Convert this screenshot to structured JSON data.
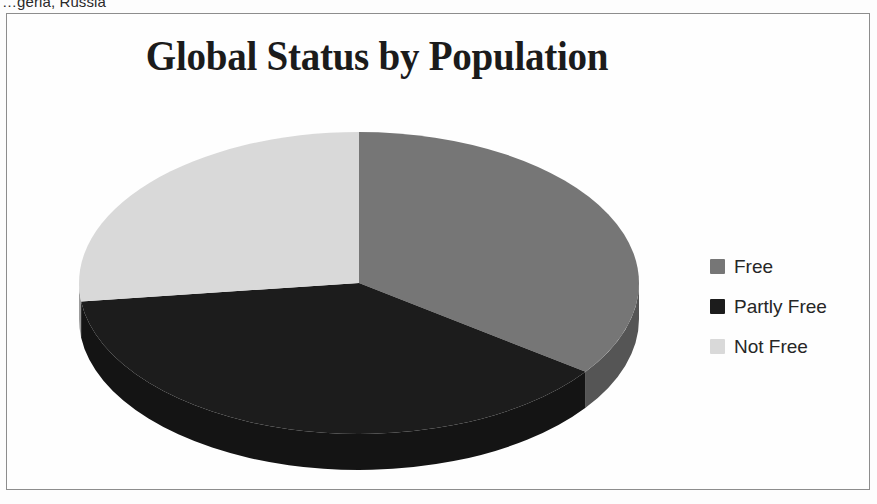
{
  "scan": {
    "top_cut_text": "…geria, Russia"
  },
  "chart": {
    "title": "Global Status by Population",
    "frame_border_color": "#8d8d8d",
    "background_color": "#fefefe"
  },
  "legend": {
    "position": "right",
    "items": [
      {
        "label": "Free",
        "color": "#767676"
      },
      {
        "label": "Partly Free",
        "color": "#1c1c1c"
      },
      {
        "label": "Not Free",
        "color": "#d9d9d9"
      }
    ]
  },
  "chart_data": {
    "type": "pie",
    "title": "Global Status by Population",
    "xlabel": "",
    "ylabel": "",
    "legend_position": "right",
    "three_d": true,
    "start_angle_deg": 0,
    "direction": "clockwise",
    "categories": [
      "Free",
      "Partly Free",
      "Not Free"
    ],
    "values": [
      35,
      38,
      27
    ],
    "units": "percent of world population",
    "colors": [
      "#767676",
      "#1c1c1c",
      "#d9d9d9"
    ],
    "slices": [
      {
        "label": "Free",
        "value": 35,
        "color": "#767676",
        "start_deg": 0,
        "end_deg": 126
      },
      {
        "label": "Partly Free",
        "value": 38,
        "color": "#1c1c1c",
        "start_deg": 126,
        "end_deg": 263
      },
      {
        "label": "Not Free",
        "value": 27,
        "color": "#d9d9d9",
        "start_deg": 263,
        "end_deg": 360
      }
    ]
  },
  "geometry": {
    "center_x": 352,
    "center_y": 269,
    "radius_x": 280,
    "radius_y": 151,
    "depth": 36
  }
}
